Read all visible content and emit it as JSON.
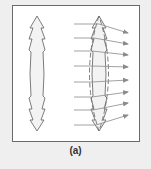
{
  "figure": {
    "caption": "(a)",
    "colors": {
      "background": "#efefef",
      "panel": "#ffffff",
      "frame": "#6a6a6a",
      "outline": "#6e6e6e",
      "lens_fill": "#eeeeee",
      "ray": "#8a8a8a"
    },
    "left_lens": {
      "label": "prism-stack lens outline",
      "center_x": 37,
      "top_y": 16,
      "bottom_y": 131
    },
    "right_lens": {
      "label": "prism-stack lens with superimposed smooth lens (dashed)",
      "center_x": 99,
      "top_y": 16,
      "bottom_y": 131
    },
    "rays": [
      {
        "y_in": 24,
        "y_out": 33
      },
      {
        "y_in": 38,
        "y_out": 44
      },
      {
        "y_in": 51,
        "y_out": 55
      },
      {
        "y_in": 66,
        "y_out": 67
      },
      {
        "y_in": 82,
        "y_out": 80
      },
      {
        "y_in": 97,
        "y_out": 92
      },
      {
        "y_in": 110,
        "y_out": 103
      },
      {
        "y_in": 125,
        "y_out": 115
      }
    ]
  }
}
